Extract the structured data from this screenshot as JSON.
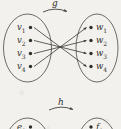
{
  "figure": {
    "background_color": "#f2f1ee",
    "ink_color": "#3a3a34"
  },
  "diagrams": [
    {
      "id": "g-mapping",
      "map_label": "g",
      "domain_set": {
        "name": "left-set",
        "nodes": [
          {
            "label": "v",
            "subscript": "1"
          },
          {
            "label": "v",
            "subscript": "2"
          },
          {
            "label": "v",
            "subscript": "3"
          },
          {
            "label": "v",
            "subscript": "4"
          }
        ]
      },
      "codomain_set": {
        "name": "right-set",
        "nodes": [
          {
            "label": "w",
            "subscript": "1"
          },
          {
            "label": "w",
            "subscript": "2"
          },
          {
            "label": "w",
            "subscript": "3"
          },
          {
            "label": "w",
            "subscript": "4"
          }
        ]
      },
      "edges": [
        {
          "from": "v1",
          "to": "w4"
        },
        {
          "from": "v2",
          "to": "w3"
        },
        {
          "from": "v3",
          "to": "w2"
        },
        {
          "from": "v4",
          "to": "w1"
        }
      ]
    },
    {
      "id": "h-mapping",
      "map_label": "h",
      "domain_set": {
        "name": "left-set-lower",
        "nodes": [
          {
            "label": "e",
            "subscript": "1"
          }
        ]
      },
      "codomain_set": {
        "name": "right-set-lower",
        "nodes": [
          {
            "label": "f",
            "subscript": "1"
          }
        ]
      }
    }
  ]
}
